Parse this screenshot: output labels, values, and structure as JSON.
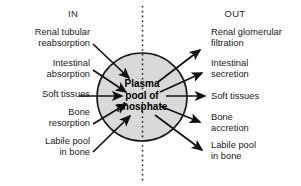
{
  "figure": {
    "title_in": "IN",
    "title_out": "OUT",
    "center_label": "Plasma\npool of\nphosphate",
    "colors": {
      "circle_fill": "#d9d9d9",
      "circle_stroke": "#1a1a1a",
      "arrow": "#111111",
      "divider": "#1a1a1a",
      "text": "#1a1a1a",
      "background": "#ffffff"
    },
    "divider": {
      "style": "vertical-dotted-line",
      "x": 142
    },
    "circle": {
      "cx": 142,
      "cy": 97,
      "rx": 45,
      "ry": 44
    },
    "inflows": [
      {
        "label": "Renal tubular\nreabsorption"
      },
      {
        "label": "Intestinal\nabsorption"
      },
      {
        "label": "Soft tissues"
      },
      {
        "label": "Bone\nresorption"
      },
      {
        "label": "Labile pool\nin bone"
      }
    ],
    "outflows": [
      {
        "label": "Renal glomerular\nfiltration"
      },
      {
        "label": "Intestinal\nsecretion"
      },
      {
        "label": "Soft tissues"
      },
      {
        "label": "Bone\naccretion"
      },
      {
        "label": "Labile pool\nin bone"
      }
    ]
  }
}
